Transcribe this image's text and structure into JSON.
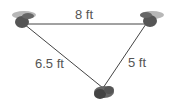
{
  "diagram": {
    "type": "triangle-distance",
    "colors": {
      "line": "#444444",
      "label": "#555555",
      "device": "#555555"
    },
    "nodes": [
      {
        "id": "left",
        "icon": "device-icon",
        "x": 22,
        "y": 23
      },
      {
        "id": "right",
        "icon": "device-icon",
        "x": 148,
        "y": 23
      },
      {
        "id": "bottom",
        "icon": "device-icon",
        "x": 103,
        "y": 90
      }
    ],
    "edges": [
      {
        "from": "left",
        "to": "right",
        "label": "8 ft"
      },
      {
        "from": "left",
        "to": "bottom",
        "label": "6.5 ft"
      },
      {
        "from": "right",
        "to": "bottom",
        "label": "5 ft"
      }
    ]
  }
}
